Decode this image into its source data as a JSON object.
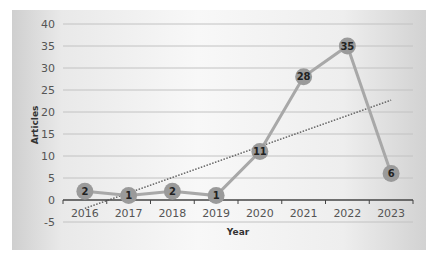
{
  "chart_data": {
    "type": "line",
    "title": "",
    "xlabel": "Year",
    "ylabel": "Articles",
    "categories": [
      "2016",
      "2017",
      "2018",
      "2019",
      "2020",
      "2021",
      "2022",
      "2023"
    ],
    "series": [
      {
        "name": "Articles",
        "values": [
          2,
          1,
          2,
          1,
          11,
          28,
          35,
          6
        ],
        "color": "#a8a8a8",
        "marker": "circle",
        "data_labels": true
      },
      {
        "name": "Linear trend",
        "type": "dotted",
        "color": "#555555",
        "start": [
          2016,
          -1.9
        ],
        "end": [
          2023,
          22.7
        ]
      }
    ],
    "ylim": [
      -5,
      40
    ],
    "yticks": [
      "40",
      "35",
      "30",
      "25",
      "20",
      "15",
      "10",
      "5",
      "0",
      "-5"
    ],
    "grid": true,
    "legend": "none"
  }
}
